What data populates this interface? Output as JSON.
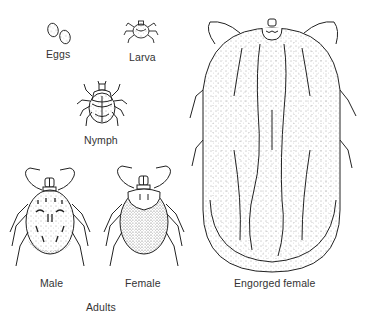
{
  "figure": {
    "stages": [
      {
        "id": "eggs",
        "label": "Eggs"
      },
      {
        "id": "larva",
        "label": "Larva"
      },
      {
        "id": "nymph",
        "label": "Nymph"
      },
      {
        "id": "male",
        "label": "Male"
      },
      {
        "id": "female",
        "label": "Female"
      },
      {
        "id": "engorged-female",
        "label": "Engorged female"
      }
    ],
    "group_label": "Adults"
  },
  "colors": {
    "background": "#ffffff",
    "ink": "#222222",
    "label": "#333333"
  }
}
